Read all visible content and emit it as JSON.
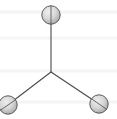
{
  "figure": {
    "type": "molecular-structure-diagram",
    "background_color": "#ffffff",
    "width": 117,
    "height": 119
  },
  "canvas": {
    "gridlines": {
      "visible": true,
      "color": "#f4f4f6",
      "thickness": 3,
      "y_positions": [
        12,
        38,
        71,
        102
      ]
    }
  },
  "structure": {
    "center_vertex": {
      "label": "central-atom",
      "x": 51,
      "y": 72,
      "rendered": false
    },
    "bonds": [
      {
        "label": "bond-top",
        "x1": 51,
        "y1": 72,
        "x2": 51,
        "y2": 15,
        "color": "#4a4a4a",
        "width": 1.1
      },
      {
        "label": "bond-bottom-left",
        "x1": 51,
        "y1": 72,
        "x2": 9,
        "y2": 104,
        "color": "#4a4a4a",
        "width": 1.1
      },
      {
        "label": "bond-bottom-right",
        "x1": 51,
        "y1": 72,
        "x2": 99,
        "y2": 104,
        "color": "#4a4a4a",
        "width": 1.1
      }
    ],
    "atoms": [
      {
        "label": "atom-top",
        "position": "top",
        "cx": 51,
        "cy": 15,
        "r": 9.5,
        "fill_light": "#e2e2e2",
        "fill_dark": "#9a9a9a",
        "outline": "#5a5a5a",
        "divider_angle_deg": 90
      },
      {
        "label": "atom-bottom-left",
        "position": "bottom-left",
        "cx": 8,
        "cy": 105,
        "r": 9.5,
        "fill_light": "#e2e2e2",
        "fill_dark": "#9a9a9a",
        "outline": "#5a5a5a",
        "divider_angle_deg": 35
      },
      {
        "label": "atom-bottom-right",
        "position": "bottom-right",
        "cx": 99,
        "cy": 104,
        "r": 9.5,
        "fill_light": "#e2e2e2",
        "fill_dark": "#9a9a9a",
        "outline": "#5a5a5a",
        "divider_angle_deg": 145
      }
    ]
  }
}
